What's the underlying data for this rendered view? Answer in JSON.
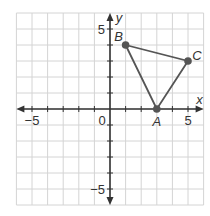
{
  "chart_data": {
    "type": "scatter",
    "title": "",
    "xlabel": "x",
    "ylabel": "y",
    "xlim": [
      -6,
      6
    ],
    "ylim": [
      -6,
      6
    ],
    "grid": true,
    "x_tick_labels": [
      {
        "value": -5,
        "label": "−5"
      },
      {
        "value": 0,
        "label": "0"
      },
      {
        "value": 5,
        "label": "5"
      }
    ],
    "y_tick_labels": [
      {
        "value": 5,
        "label": "5"
      },
      {
        "value": -5,
        "label": "−5"
      }
    ],
    "points": [
      {
        "name": "A",
        "x": 3,
        "y": 0
      },
      {
        "name": "B",
        "x": 1,
        "y": 4
      },
      {
        "name": "C",
        "x": 5,
        "y": 3
      }
    ],
    "polygon": [
      "A",
      "B",
      "C"
    ],
    "colors": {
      "grid": "#d4d4d4",
      "axis": "#333333",
      "triangle": "#555555",
      "point": "#555555"
    }
  }
}
